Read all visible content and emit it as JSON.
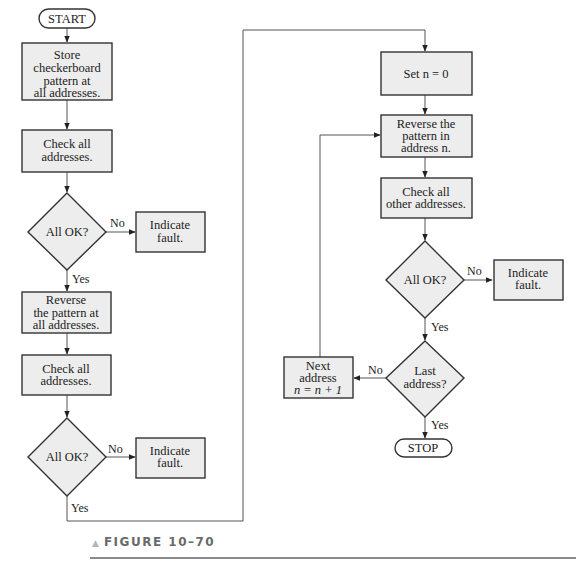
{
  "figure": {
    "caption": "FIGURE 10–70"
  },
  "nodes": {
    "start": "START",
    "store_pattern": [
      "Store",
      "checkerboard",
      "pattern at",
      "all addresses."
    ],
    "check_all_1": [
      "Check all",
      "addresses."
    ],
    "all_ok_1": "All OK?",
    "fault_1": [
      "Indicate",
      "fault."
    ],
    "reverse_all": [
      "Reverse",
      "the pattern at",
      "all addresses."
    ],
    "check_all_2": [
      "Check all",
      "addresses."
    ],
    "all_ok_2": "All OK?",
    "fault_2": [
      "Indicate",
      "fault."
    ],
    "set_n": "Set n = 0",
    "reverse_n": [
      "Reverse the",
      "pattern in",
      "address n."
    ],
    "check_other": [
      "Check all",
      "other addresses."
    ],
    "all_ok_3": "All OK?",
    "fault_3": [
      "Indicate",
      "fault."
    ],
    "last_address": [
      "Last",
      "address?"
    ],
    "next_address": [
      "Next",
      "address",
      "n = n + 1"
    ],
    "stop": "STOP"
  },
  "edge_labels": {
    "no": "No",
    "yes": "Yes"
  }
}
